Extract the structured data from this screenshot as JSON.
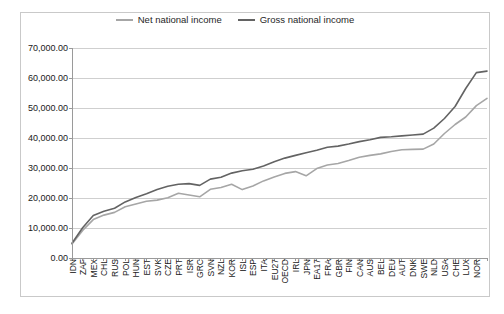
{
  "chart_data": {
    "type": "line",
    "title": "",
    "xlabel": "",
    "ylabel": "",
    "ylim": [
      0,
      70000
    ],
    "y_ticks": [
      0,
      10000,
      20000,
      30000,
      40000,
      50000,
      60000,
      70000
    ],
    "y_tick_labels": [
      "0.00",
      "10,000.00",
      "20,000.00",
      "30,000.00",
      "40,000.00",
      "50,000.00",
      "60,000.00",
      "70,000.00"
    ],
    "grid": true,
    "legend_position": "top-center",
    "categories": [
      "IDN",
      "ZAF",
      "MEX",
      "CHL",
      "RUS",
      "POL",
      "HUN",
      "EST",
      "SVK",
      "CZE",
      "PRT",
      "ISR",
      "GRC",
      "SVN",
      "NZL",
      "KOR",
      "ISL",
      "ESP",
      "ITA",
      "EU27",
      "OECD",
      "IRL",
      "JPN",
      "EA17",
      "FRA",
      "GBR",
      "FIN",
      "CAN",
      "AUS",
      "BEL",
      "DEU",
      "AUT",
      "DNK",
      "SWE",
      "NLD",
      "USA",
      "CHE",
      "LUX",
      "NOR",
      "NOR2"
    ],
    "series": [
      {
        "name": "Net national income",
        "color": "#a6a6a6",
        "values": [
          4700,
          9200,
          12800,
          14300,
          15200,
          17100,
          18000,
          18900,
          19300,
          20100,
          21600,
          21000,
          20400,
          22900,
          23500,
          24600,
          22800,
          24000,
          25700,
          27000,
          28200,
          28800,
          27400,
          29800,
          31000,
          31500,
          32500,
          33600,
          34200,
          34700,
          35500,
          36100,
          36200,
          36300,
          38000,
          41500,
          44500,
          47000,
          50800,
          53200
        ]
      },
      {
        "name": "Gross national income",
        "color": "#636363",
        "values": [
          4900,
          10100,
          14200,
          15600,
          16600,
          18700,
          20200,
          21400,
          22800,
          23900,
          24600,
          24800,
          24200,
          26300,
          26900,
          28300,
          29100,
          29600,
          30700,
          32100,
          33300,
          34200,
          35100,
          35900,
          36900,
          37300,
          38000,
          38800,
          39400,
          40200,
          40400,
          40700,
          41000,
          41300,
          43300,
          46500,
          50500,
          56500,
          61800,
          62300
        ]
      }
    ]
  },
  "legend": {
    "entries": [
      {
        "label": "Net national income",
        "color": "#a6a6a6"
      },
      {
        "label": "Gross national income",
        "color": "#636363"
      }
    ]
  }
}
